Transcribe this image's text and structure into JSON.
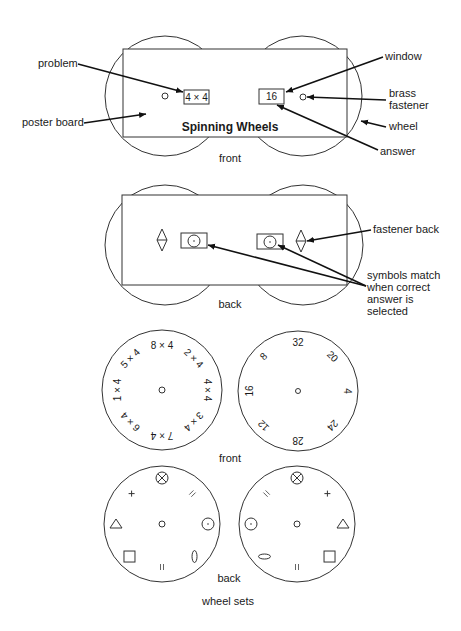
{
  "front_view": {
    "title": "Spinning Wheels",
    "problem_window": "4 × 4",
    "answer_window": "16",
    "caption": "front",
    "labels": {
      "problem": "problem",
      "poster_board": "poster board",
      "window": "window",
      "brass_fastener_line1": "brass",
      "brass_fastener_line2": "fastener",
      "wheel": "wheel",
      "answer": "answer"
    }
  },
  "back_view": {
    "caption": "back",
    "labels": {
      "fastener_back": "fastener back",
      "symbols_line1": "symbols match",
      "symbols_line2": "when correct",
      "symbols_line3": "answer is",
      "symbols_line4": "selected"
    }
  },
  "wheel_sets": {
    "front_caption": "front",
    "back_caption": "back",
    "caption": "wheel sets",
    "problem_wheel": [
      "8 × 4",
      "2 × 4",
      "4 × 4",
      "3 × 4",
      "7 × 4",
      "6 × 4",
      "1 × 4",
      "5 × 4"
    ],
    "answer_wheel": [
      "32",
      "20",
      "4",
      "24",
      "28",
      "12",
      "16",
      "8"
    ],
    "back_left_symbols": [
      "circle-x",
      "double-line",
      "circle-dot",
      "ellipse",
      "double-line",
      "square",
      "triangle",
      "plus"
    ],
    "back_right_symbols": [
      "circle-x",
      "plus",
      "triangle",
      "square",
      "double-line",
      "ellipse",
      "circle-dot",
      "double-line"
    ]
  }
}
